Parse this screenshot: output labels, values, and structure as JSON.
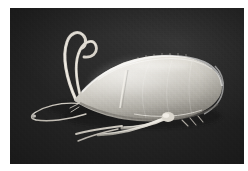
{
  "plate": {
    "width_px": 248,
    "height_px": 171,
    "page_background": "#ffffff",
    "margin_left_px": 10,
    "margin_top_px": 8,
    "photo": {
      "left_px": 10,
      "top_px": 8,
      "width_px": 234,
      "height_px": 156,
      "background_color": "#2b2b2b",
      "background_description": "dark charcoal matte backdrop",
      "medium": "grayscale scanning electron / photographic micrograph",
      "caption": ""
    }
  },
  "subject": {
    "name": "specimen",
    "common_description": "elongate teardrop-shaped microcrustacean carapace with antennae and legs",
    "orientation": "anterior to the left, posterior rounded to the right",
    "body_color_highlight": "#e8e6e0",
    "body_color_midtone": "#c3c0b8",
    "body_color_shadow": "#8d8a83",
    "appendage_color": "#ded9d0",
    "parts": [
      {
        "id": "carapace",
        "label": "carapace",
        "note": "ovoid valve, brightest along upper rim"
      },
      {
        "id": "anterior-taper",
        "label": "anterior taper",
        "note": "narrow neck leading to antennal base"
      },
      {
        "id": "antenna-upper",
        "label": "upper antenna",
        "note": "long curved flagellum sweeping up and right"
      },
      {
        "id": "antenna-lower",
        "label": "lower antenna",
        "note": "second curved flagellum, hooks left"
      },
      {
        "id": "filament-loop",
        "label": "ventral filament",
        "note": "thin wire-like appendage looping down-left"
      },
      {
        "id": "leg-anterior",
        "label": "anterior leg",
        "note": "slender limb directed left"
      },
      {
        "id": "leg-middle",
        "label": "middle leg",
        "note": "slender limb directed down-left"
      },
      {
        "id": "leg-posterior",
        "label": "posterior leg",
        "note": "limb directed left from mid-ventral joint"
      },
      {
        "id": "caudal-setae",
        "label": "caudal setae",
        "note": "short bristles at ventro-posterior margin"
      },
      {
        "id": "dorsal-ridge",
        "label": "dorsal ridge",
        "note": "faint suture line along the valve"
      },
      {
        "id": "ventral-line",
        "label": "ventral margin line",
        "note": "thin bright line inside lower valve edge"
      }
    ]
  }
}
